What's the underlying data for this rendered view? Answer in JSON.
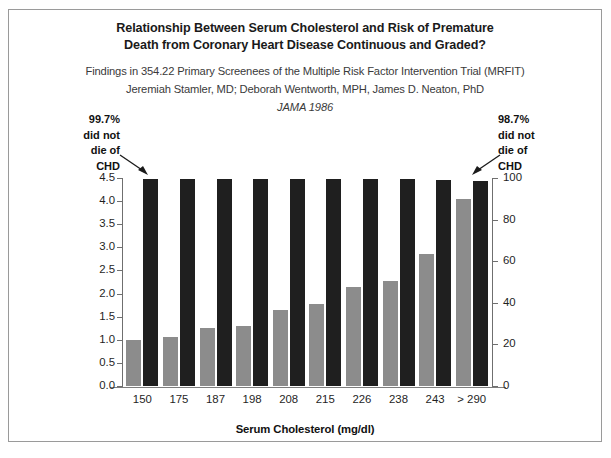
{
  "figure": {
    "title_lines": [
      "Relationship Between Serum Cholesterol and Risk of Premature",
      "Death from Coronary Heart Disease Continuous and Graded?"
    ],
    "subtitle_lines": [
      "Findings in 354.22 Primary Screenees of the Multiple Risk Factor Intervention Trial (MRFIT)",
      "Jeremiah Stamler, MD; Deborah Wentworth, MPH, James D. Neaton, PhD"
    ],
    "journal_line": "JAMA 1986",
    "annotation_left": "99.7%\ndid not\ndie of\nCHD",
    "annotation_right": "98.7%\ndid not\ndie of\nCHD",
    "annotation_left_lines": [
      "99.7%",
      "did not",
      "die of",
      "CHD"
    ],
    "annotation_right_lines": [
      "98.7%",
      "did not",
      "die of",
      "CHD"
    ],
    "arrow_left_name": "arrow-pointing-to-first-black-bar",
    "arrow_right_name": "arrow-pointing-to-last-black-bar"
  },
  "chart_data": {
    "type": "bar",
    "title": "Relationship Between Serum Cholesterol and Risk of Premature Death from Coronary Heart Disease Continuous and Graded?",
    "subtitle": "Findings in 354.22 Primary Screenees of the Multiple Risk Factor Intervention Trial (MRFIT)",
    "xlabel": "Serum Cholesterol (mg/dl)",
    "ylabel": "",
    "ylabel_right": "",
    "grid": false,
    "legend": "none",
    "categories": [
      "150",
      "175",
      "187",
      "198",
      "208",
      "215",
      "226",
      "238",
      "243",
      "> 290"
    ],
    "series": [
      {
        "name": "CHD death rate (left axis)",
        "axis": "left",
        "color": "#8c8c8c",
        "values": [
          1.0,
          1.05,
          1.25,
          1.3,
          1.65,
          1.78,
          2.15,
          2.28,
          2.85,
          4.05
        ]
      },
      {
        "name": "Did not die of CHD (%) (right axis)",
        "axis": "right",
        "color": "#1f1f1f",
        "values": [
          99.7,
          99.7,
          99.7,
          99.7,
          99.6,
          99.5,
          99.4,
          99.3,
          99.0,
          98.7
        ]
      }
    ],
    "ylim_left": [
      0.0,
      4.5
    ],
    "ylim_right": [
      0,
      100
    ],
    "yticks_left": [
      "0.0",
      "0.5",
      "1.0",
      "1.5",
      "2.0",
      "2.5",
      "3.0",
      "3.5",
      "4.0",
      "4.5"
    ],
    "yticks_left_values": [
      0.0,
      0.5,
      1.0,
      1.5,
      2.0,
      2.5,
      3.0,
      3.5,
      4.0,
      4.5
    ],
    "yticks_right": [
      "0",
      "20",
      "40",
      "60",
      "80",
      "100"
    ],
    "yticks_right_values": [
      0,
      20,
      40,
      60,
      80,
      100
    ]
  }
}
